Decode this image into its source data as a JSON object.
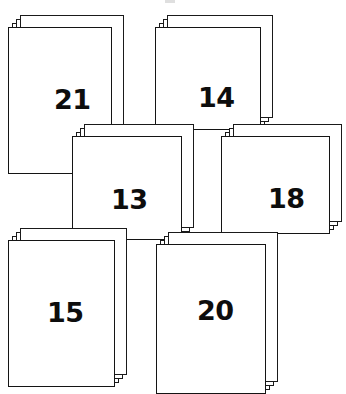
{
  "page": {
    "background_color": "#ffffff",
    "ink_color": "#141414",
    "width": 346,
    "height": 391
  },
  "stacks": [
    {
      "id": "stack-21",
      "label": "21",
      "value": 21,
      "position": "top-left",
      "x": 8,
      "y": 15,
      "width": 104,
      "height": 147,
      "sheets": 4,
      "number_x": 45,
      "number_y": 58
    },
    {
      "id": "stack-14",
      "label": "14",
      "value": 14,
      "position": "top-right",
      "x": 155,
      "y": 15,
      "width": 106,
      "height": 103,
      "sheets": 4,
      "number_x": 42,
      "number_y": 56
    },
    {
      "id": "stack-13",
      "label": "13",
      "value": 13,
      "position": "middle-left",
      "x": 72,
      "y": 124,
      "width": 110,
      "height": 104,
      "sheets": 4,
      "number_x": 38,
      "number_y": 49
    },
    {
      "id": "stack-18",
      "label": "18",
      "value": 18,
      "position": "middle-right",
      "x": 221,
      "y": 124,
      "width": 109,
      "height": 98,
      "sheets": 4,
      "number_x": 46,
      "number_y": 48
    },
    {
      "id": "stack-15",
      "label": "15",
      "value": 15,
      "position": "bottom-left",
      "x": 8,
      "y": 228,
      "width": 107,
      "height": 147,
      "sheets": 4,
      "number_x": 38,
      "number_y": 58
    },
    {
      "id": "stack-20",
      "label": "20",
      "value": 20,
      "position": "bottom-right",
      "x": 156,
      "y": 232,
      "width": 110,
      "height": 150,
      "sheets": 4,
      "number_x": 40,
      "number_y": 52
    }
  ],
  "chart_data": {
    "type": "bar",
    "categories": [
      "21",
      "14",
      "13",
      "18",
      "15",
      "20"
    ],
    "values": [
      21,
      14,
      13,
      18,
      15,
      20
    ],
    "xlabel": "",
    "ylabel": "",
    "legend": []
  }
}
